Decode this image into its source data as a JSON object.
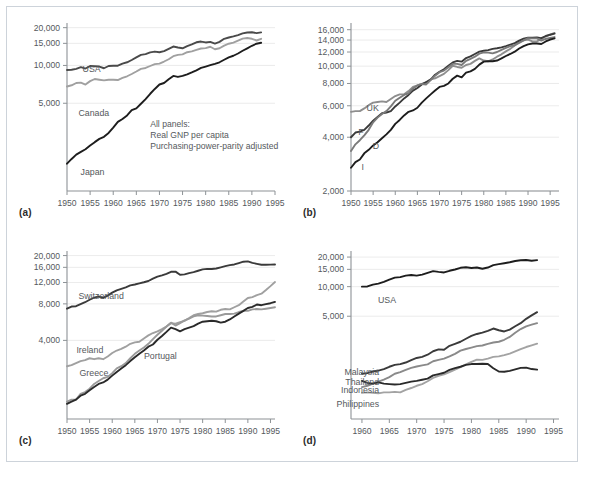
{
  "figure": {
    "note_lines": [
      "All panels:",
      "Real GNP per capita",
      "Purchasing-power-parity adjusted"
    ],
    "panel_labels": [
      "(a)",
      "(b)",
      "(c)",
      "(d)"
    ],
    "colors": {
      "black": "#1d1d1d",
      "dark_gray": "#4a4a4a",
      "mid_gray": "#6f6f6f",
      "light_gray": "#a0a0a0",
      "grid": "#e3e3e3",
      "axis": "#8d9296",
      "frame": "#cdd3da",
      "text": "#55595d"
    }
  },
  "chart_data": [
    {
      "type": "line",
      "panel": "(a)",
      "title": "",
      "xlabel": "",
      "ylabel": "",
      "xlim": [
        1950,
        1995
      ],
      "ylim": [
        1000,
        21000
      ],
      "yscale": "log",
      "grid": true,
      "legend": "inline-labels",
      "xticks": [
        1950,
        1955,
        1960,
        1965,
        1970,
        1975,
        1980,
        1985,
        1990,
        1995
      ],
      "yticks": [
        5000,
        10000,
        15000,
        20000
      ],
      "yticklabels": [
        "5,000",
        "10,000",
        "15,000",
        "20,000"
      ],
      "annotations": [
        "All panels:",
        "Real GNP per capita",
        "Purchasing-power-parity adjusted"
      ],
      "x": [
        1950,
        1951,
        1952,
        1953,
        1954,
        1955,
        1956,
        1957,
        1958,
        1959,
        1960,
        1961,
        1962,
        1963,
        1964,
        1965,
        1966,
        1967,
        1968,
        1969,
        1970,
        1971,
        1972,
        1973,
        1974,
        1975,
        1976,
        1977,
        1978,
        1979,
        1980,
        1981,
        1982,
        1983,
        1984,
        1985,
        1986,
        1987,
        1988,
        1989,
        1990,
        1991,
        1992
      ],
      "series": [
        {
          "name": "USA",
          "color": "#4a4a4a",
          "values": [
            9200,
            9250,
            9400,
            9700,
            9450,
            9900,
            9850,
            9800,
            9500,
            9900,
            9950,
            9950,
            10350,
            10600,
            11050,
            11600,
            12150,
            12300,
            12700,
            12900,
            12750,
            13000,
            13550,
            14150,
            13900,
            13700,
            14250,
            14700,
            15300,
            15500,
            15250,
            15400,
            14950,
            15400,
            16300,
            16700,
            17050,
            17450,
            18000,
            18300,
            18400,
            18100,
            18350
          ]
        },
        {
          "name": "Canada",
          "color": "#a0a0a0",
          "values": [
            6800,
            6950,
            7250,
            7300,
            7050,
            7500,
            7800,
            7700,
            7600,
            7700,
            7700,
            7650,
            7950,
            8200,
            8550,
            8950,
            9400,
            9550,
            9900,
            10250,
            10350,
            10750,
            11200,
            11850,
            12150,
            12250,
            12750,
            12950,
            13300,
            13650,
            13750,
            14100,
            13450,
            13700,
            14400,
            14900,
            15200,
            15750,
            16350,
            16550,
            16300,
            15800,
            16300
          ]
        },
        {
          "name": "Japan",
          "color": "#1d1d1d",
          "values": [
            1650,
            1800,
            1950,
            2050,
            2150,
            2300,
            2450,
            2600,
            2700,
            2900,
            3200,
            3550,
            3750,
            4000,
            4400,
            4550,
            4950,
            5400,
            5950,
            6500,
            7050,
            7250,
            7750,
            8250,
            8100,
            8250,
            8500,
            8800,
            9150,
            9550,
            9800,
            10050,
            10300,
            10600,
            11100,
            11600,
            11950,
            12450,
            13100,
            13700,
            14350,
            14900,
            15150
          ]
        }
      ]
    },
    {
      "type": "line",
      "panel": "(b)",
      "title": "",
      "xlabel": "",
      "ylabel": "",
      "xlim": [
        1950,
        1997
      ],
      "ylim": [
        2000,
        17000
      ],
      "yscale": "log",
      "grid": true,
      "legend": "inline-labels",
      "xticks": [
        1950,
        1955,
        1960,
        1965,
        1970,
        1975,
        1980,
        1985,
        1990,
        1995
      ],
      "yticks": [
        2000,
        4000,
        6000,
        8000,
        10000,
        12000,
        14000,
        16000
      ],
      "yticklabels": [
        "2,000",
        "4,000",
        "6,000",
        "8,000",
        "10,000",
        "12,000",
        "14,000",
        "16,000"
      ],
      "x": [
        1950,
        1951,
        1952,
        1953,
        1954,
        1955,
        1956,
        1957,
        1958,
        1959,
        1960,
        1961,
        1962,
        1963,
        1964,
        1965,
        1966,
        1967,
        1968,
        1969,
        1970,
        1971,
        1972,
        1973,
        1974,
        1975,
        1976,
        1977,
        1978,
        1979,
        1980,
        1981,
        1982,
        1983,
        1984,
        1985,
        1986,
        1987,
        1988,
        1989,
        1990,
        1991,
        1992,
        1993,
        1994,
        1995,
        1996
      ],
      "series": [
        {
          "name": "UK",
          "color": "#8e8e8e",
          "values": [
            5550,
            5600,
            5600,
            5800,
            6050,
            6250,
            6300,
            6350,
            6300,
            6550,
            6800,
            6950,
            6950,
            7250,
            7650,
            7800,
            7950,
            8100,
            8450,
            8550,
            8800,
            9050,
            9500,
            10050,
            9900,
            9800,
            10150,
            10300,
            10700,
            11050,
            10750,
            10650,
            10900,
            11300,
            11650,
            12100,
            12500,
            13050,
            13650,
            13950,
            14100,
            13750,
            13750,
            14150,
            14650,
            15000,
            15350
          ]
        },
        {
          "name": "F",
          "color": "#3a3a3a",
          "values": [
            4000,
            4250,
            4300,
            4400,
            4650,
            4950,
            5200,
            5450,
            5500,
            5600,
            5950,
            6250,
            6600,
            6900,
            7300,
            7550,
            7900,
            8150,
            8400,
            8950,
            9300,
            9600,
            10050,
            10500,
            10700,
            10600,
            11100,
            11350,
            11700,
            12050,
            12200,
            12300,
            12500,
            12600,
            12750,
            12950,
            13200,
            13450,
            13900,
            14250,
            14450,
            14450,
            14500,
            14350,
            14750,
            15000,
            15200
          ]
        },
        {
          "name": "D",
          "color": "#7a7a7a",
          "values": [
            3350,
            3650,
            3850,
            4100,
            4400,
            4850,
            5150,
            5400,
            5600,
            5950,
            6400,
            6650,
            6900,
            7050,
            7500,
            7800,
            7950,
            7900,
            8350,
            8850,
            9250,
            9450,
            9850,
            10300,
            10300,
            10150,
            10700,
            11000,
            11300,
            11750,
            11950,
            11900,
            11800,
            12000,
            12350,
            12650,
            12950,
            13100,
            13500,
            13950,
            14350,
            14300,
            14300,
            13900,
            14200,
            14400,
            14550
          ]
        },
        {
          "name": "I",
          "color": "#1d1d1d",
          "values": [
            2700,
            2900,
            3000,
            3250,
            3400,
            3600,
            3750,
            3950,
            4150,
            4400,
            4750,
            5000,
            5300,
            5550,
            5650,
            5850,
            6250,
            6600,
            6950,
            7300,
            7650,
            7750,
            8000,
            8500,
            8850,
            8650,
            9200,
            9350,
            9650,
            10200,
            10600,
            10650,
            10650,
            10750,
            11050,
            11400,
            11700,
            12050,
            12550,
            12950,
            13250,
            13400,
            13400,
            13300,
            13750,
            14100,
            14300
          ]
        }
      ]
    },
    {
      "type": "line",
      "panel": "(c)",
      "title": "",
      "xlabel": "",
      "ylabel": "",
      "xlim": [
        1950,
        1996
      ],
      "ylim": [
        900,
        21000
      ],
      "yscale": "log",
      "grid": true,
      "legend": "inline-labels",
      "xticks": [
        1950,
        1955,
        1960,
        1965,
        1970,
        1975,
        1980,
        1985,
        1990,
        1995
      ],
      "yticks": [
        4000,
        8000,
        12000,
        16000,
        20000
      ],
      "yticklabels": [
        "4,000",
        "8,000",
        "12,000",
        "16,000",
        "20,000"
      ],
      "x": [
        1950,
        1951,
        1952,
        1953,
        1954,
        1955,
        1956,
        1957,
        1958,
        1959,
        1960,
        1961,
        1962,
        1963,
        1964,
        1965,
        1966,
        1967,
        1968,
        1969,
        1970,
        1971,
        1972,
        1973,
        1974,
        1975,
        1976,
        1977,
        1978,
        1979,
        1980,
        1981,
        1982,
        1983,
        1984,
        1985,
        1986,
        1987,
        1988,
        1989,
        1990,
        1991,
        1992,
        1993,
        1994,
        1995,
        1996
      ],
      "series": [
        {
          "name": "Switzerland",
          "color": "#3a3a3a",
          "values": [
            7300,
            7600,
            7650,
            7950,
            8250,
            8650,
            9000,
            9200,
            8950,
            9350,
            9900,
            10350,
            10650,
            10950,
            11350,
            11550,
            11800,
            12050,
            12350,
            12900,
            13400,
            13750,
            14150,
            14700,
            14750,
            13900,
            14000,
            14350,
            14600,
            15000,
            15400,
            15550,
            15500,
            15650,
            16000,
            16350,
            16700,
            16900,
            17350,
            17800,
            17900,
            17400,
            17100,
            16800,
            16800,
            16850,
            16900
          ]
        },
        {
          "name": "Ireland",
          "color": "#a0a0a0",
          "values": [
            2450,
            2500,
            2600,
            2700,
            2750,
            2850,
            2800,
            2850,
            2800,
            2950,
            3150,
            3300,
            3400,
            3550,
            3750,
            3850,
            3900,
            4150,
            4400,
            4600,
            4750,
            4950,
            5200,
            5550,
            5500,
            5650,
            5800,
            6100,
            6450,
            6600,
            6700,
            6850,
            6950,
            6900,
            7150,
            7250,
            7200,
            7500,
            7800,
            8350,
            8950,
            9100,
            9450,
            9700,
            10400,
            11200,
            12100,
            13500
          ]
        },
        {
          "name": "Greece",
          "color": "#9a9a9a",
          "values": [
            1250,
            1300,
            1300,
            1450,
            1500,
            1600,
            1750,
            1850,
            1950,
            2000,
            2150,
            2350,
            2450,
            2600,
            2850,
            3100,
            3300,
            3500,
            3750,
            4100,
            4450,
            4800,
            5200,
            5600,
            5300,
            5550,
            5850,
            6050,
            6300,
            6450,
            6400,
            6350,
            6300,
            6300,
            6450,
            6600,
            6600,
            6650,
            6850,
            7000,
            7000,
            7200,
            7250,
            7200,
            7300,
            7400,
            7500
          ]
        },
        {
          "name": "Portugal",
          "color": "#2a2a2a",
          "values": [
            1200,
            1250,
            1300,
            1400,
            1450,
            1550,
            1650,
            1750,
            1800,
            1900,
            2050,
            2200,
            2350,
            2500,
            2700,
            2900,
            3100,
            3300,
            3550,
            3700,
            4050,
            4350,
            4700,
            5100,
            4950,
            4750,
            4950,
            5100,
            5250,
            5500,
            5700,
            5750,
            5800,
            5750,
            5600,
            5700,
            5950,
            6300,
            6650,
            7000,
            7400,
            7550,
            7900,
            7800,
            7950,
            8100,
            8300
          ]
        }
      ]
    },
    {
      "type": "line",
      "panel": "(d)",
      "title": "",
      "xlabel": "",
      "ylabel": "",
      "xlim": [
        1958,
        1996
      ],
      "ylim": [
        450,
        22000
      ],
      "yscale": "log",
      "grid": true,
      "legend": "inline-labels",
      "xticks": [
        1960,
        1965,
        1970,
        1975,
        1980,
        1985,
        1990,
        1995
      ],
      "yticks": [
        5000,
        10000,
        15000,
        20000
      ],
      "yticklabels": [
        "5,000",
        "10,000",
        "15,000",
        "20,000"
      ],
      "x": [
        1960,
        1961,
        1962,
        1963,
        1964,
        1965,
        1966,
        1967,
        1968,
        1969,
        1970,
        1971,
        1972,
        1973,
        1974,
        1975,
        1976,
        1977,
        1978,
        1979,
        1980,
        1981,
        1982,
        1983,
        1984,
        1985,
        1986,
        1987,
        1988,
        1989,
        1990,
        1991,
        1992
      ],
      "series": [
        {
          "name": "USA",
          "color": "#1d1d1d",
          "values": [
            10000,
            10050,
            10500,
            10750,
            11200,
            11800,
            12350,
            12500,
            12950,
            13150,
            12950,
            13250,
            13800,
            14400,
            14150,
            13950,
            14500,
            14950,
            15550,
            15750,
            15500,
            15650,
            15200,
            15650,
            16550,
            16950,
            17300,
            17700,
            18250,
            18550,
            18650,
            18350,
            18600
          ]
        },
        {
          "name": "Malaysia",
          "color": "#3a3a3a",
          "values": [
            1300,
            1320,
            1370,
            1400,
            1450,
            1530,
            1600,
            1630,
            1690,
            1790,
            1880,
            1930,
            2030,
            2200,
            2300,
            2280,
            2500,
            2620,
            2750,
            2950,
            3150,
            3300,
            3400,
            3550,
            3750,
            3600,
            3500,
            3650,
            3950,
            4250,
            4700,
            5100,
            5500,
            5900
          ]
        },
        {
          "name": "Thailand",
          "color": "#8a8a8a",
          "values": [
            950,
            980,
            1030,
            1080,
            1130,
            1200,
            1300,
            1350,
            1420,
            1490,
            1540,
            1580,
            1620,
            1740,
            1800,
            1850,
            1950,
            2070,
            2230,
            2320,
            2400,
            2480,
            2520,
            2620,
            2700,
            2750,
            2880,
            3080,
            3400,
            3700,
            3950,
            4100,
            4250
          ]
        },
        {
          "name": "Indonesia",
          "color": "#a3a3a3",
          "values": [
            830,
            840,
            830,
            820,
            840,
            840,
            850,
            840,
            890,
            930,
            980,
            1020,
            1090,
            1180,
            1240,
            1280,
            1350,
            1430,
            1520,
            1620,
            1720,
            1810,
            1800,
            1850,
            1930,
            1950,
            2010,
            2080,
            2190,
            2310,
            2430,
            2530,
            2630
          ]
        },
        {
          "name": "Philippines",
          "color": "#2a2a2a",
          "values": [
            1100,
            1050,
            1030,
            1060,
            1030,
            1020,
            1010,
            1020,
            1050,
            1080,
            1100,
            1130,
            1160,
            1250,
            1290,
            1330,
            1420,
            1480,
            1530,
            1600,
            1630,
            1630,
            1640,
            1630,
            1480,
            1370,
            1360,
            1390,
            1440,
            1490,
            1500,
            1450,
            1430
          ]
        }
      ]
    }
  ]
}
